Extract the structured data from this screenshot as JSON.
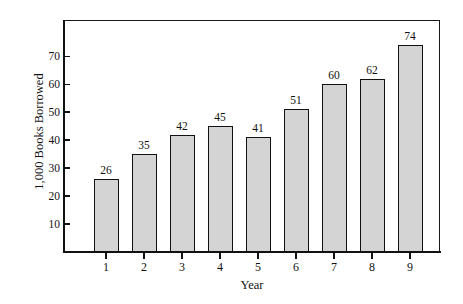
{
  "chart_data": {
    "type": "bar",
    "title": "",
    "subtitle": "",
    "xlabel": "Year",
    "ylabel": "1,000 Books Borrowed",
    "categories": [
      "1",
      "2",
      "3",
      "4",
      "5",
      "6",
      "7",
      "8",
      "9"
    ],
    "values": [
      26,
      35,
      42,
      45,
      41,
      51,
      60,
      62,
      74
    ],
    "data_labels": [
      "26",
      "35",
      "42",
      "45",
      "41",
      "51",
      "60",
      "62",
      "74"
    ],
    "ylim": [
      0,
      83
    ],
    "yticks": [
      10,
      20,
      30,
      40,
      50,
      60,
      70
    ],
    "ytick_labels": [
      "10",
      "20",
      "30",
      "40",
      "50",
      "60",
      "70"
    ],
    "xtick_labels": [
      "1",
      "2",
      "3",
      "4",
      "5",
      "6",
      "7",
      "8",
      "9"
    ],
    "grid": false,
    "legend": false,
    "legend_position": "none",
    "bar_fill_color": "#d4d4d4",
    "bar_edge_color": "#111111",
    "axis_color": "#111111",
    "background_color": "#ffffff",
    "frame": "box"
  }
}
